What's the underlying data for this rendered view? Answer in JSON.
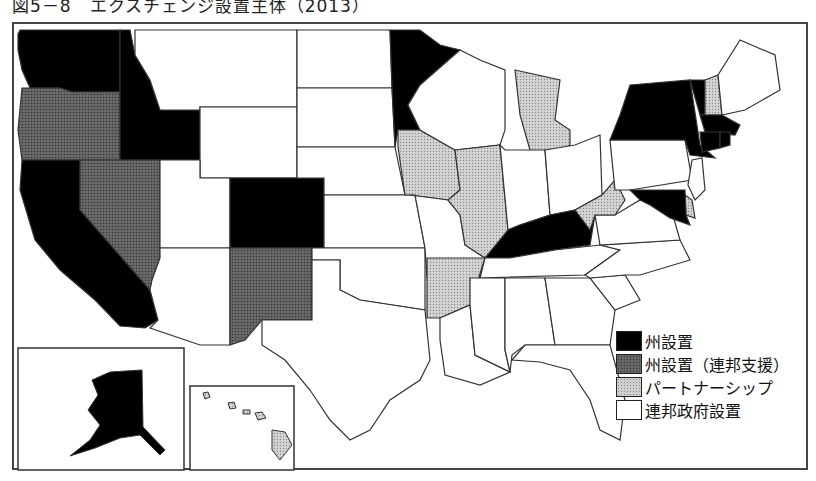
{
  "title": "図5－8　エクスチェンジ設置主体（2013）",
  "legend": [
    {
      "key": "state",
      "label": "州設置",
      "color": "#000000"
    },
    {
      "key": "state_federal_support",
      "label": "州設置（連邦支援）",
      "color": "#666666"
    },
    {
      "key": "partnership",
      "label": "パートナーシップ",
      "color": "#d0d0d0"
    },
    {
      "key": "federal",
      "label": "連邦政府設置",
      "color": "#ffffff"
    }
  ],
  "states": {
    "state": [
      "WA",
      "ID",
      "CA",
      "CO",
      "MN",
      "KY",
      "NY",
      "VT",
      "MA",
      "CT",
      "RI",
      "MD",
      "AK"
    ],
    "state_federal_support": [
      "OR",
      "NV",
      "NM"
    ],
    "partnership": [
      "IA",
      "IL",
      "MI",
      "WV",
      "AR",
      "NH",
      "DE",
      "HI"
    ],
    "federal": [
      "MT",
      "WY",
      "UT",
      "AZ",
      "ND",
      "SD",
      "NE",
      "KS",
      "OK",
      "TX",
      "MO",
      "LA",
      "WI",
      "IN",
      "OH",
      "PA",
      "NJ",
      "ME",
      "TN",
      "MS",
      "AL",
      "GA",
      "FL",
      "SC",
      "NC",
      "VA"
    ]
  },
  "insets": [
    "Alaska",
    "Hawaii"
  ]
}
